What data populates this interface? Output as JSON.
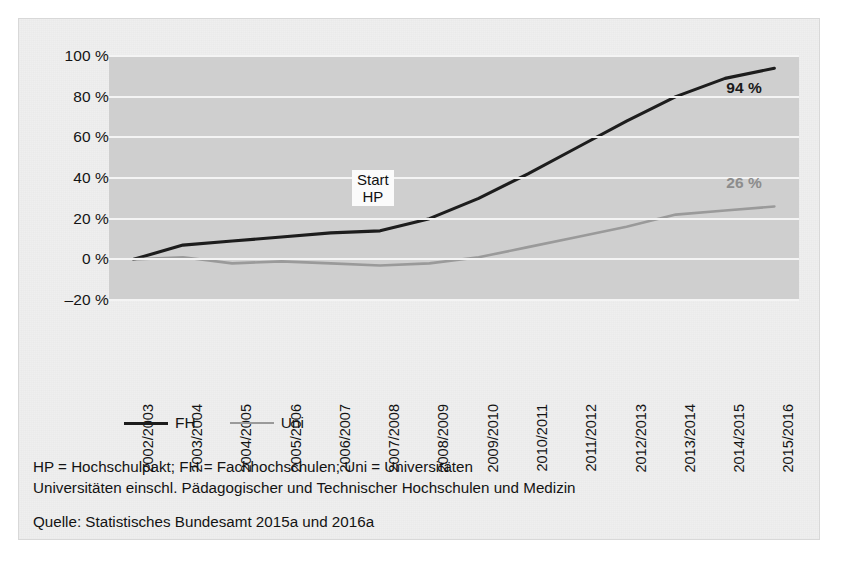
{
  "chart_data": {
    "type": "line",
    "title": "",
    "subtitle": "",
    "xlabel": "",
    "ylabel": "",
    "ylim": [
      -20,
      100
    ],
    "yticks": [
      100,
      80,
      60,
      40,
      20,
      0,
      -20
    ],
    "ytick_labels": [
      "100 %",
      "80 %",
      "60 %",
      "40 %",
      "20 %",
      "0 %",
      "–20 %"
    ],
    "grid": true,
    "legend_position": "below-plot-left",
    "categories": [
      "2002/2003",
      "2003/2004",
      "2004/2005",
      "2005/2006",
      "2006/2007",
      "2007/2008",
      "2008/2009",
      "2009/2010",
      "2010/2011",
      "2011/2012",
      "2012/2013",
      "2013/2014",
      "2014/2015",
      "2015/2016"
    ],
    "series": [
      {
        "name": "FH",
        "color": "#1d1d1d",
        "values": [
          0,
          7,
          9,
          11,
          13,
          14,
          20,
          30,
          42,
          55,
          68,
          80,
          89,
          94
        ],
        "end_label": "94 %"
      },
      {
        "name": "Uni",
        "color": "#9a9a9a",
        "values": [
          0,
          1,
          -2,
          -1,
          -2,
          -3,
          -2,
          1,
          6,
          11,
          16,
          22,
          24,
          26
        ],
        "end_label": "26 %"
      }
    ],
    "annotations": [
      {
        "name": "start-hp",
        "line1": "Start",
        "line2": "HP",
        "at_category": "2007/2008"
      }
    ]
  },
  "legend": {
    "items": [
      {
        "label": "FH",
        "color": "#1d1d1d"
      },
      {
        "label": "Uni",
        "color": "#9a9a9a"
      }
    ]
  },
  "footnotes": {
    "abbreviations": "HP = Hochschulpakt; FH = Fachhochschulen; Uni = Universitäten",
    "scope": "Universitäten einschl. Pädagogischer und Technischer Hochschulen und Medizin",
    "source": "Quelle: Statistisches Bundesamt 2015a und 2016a"
  }
}
